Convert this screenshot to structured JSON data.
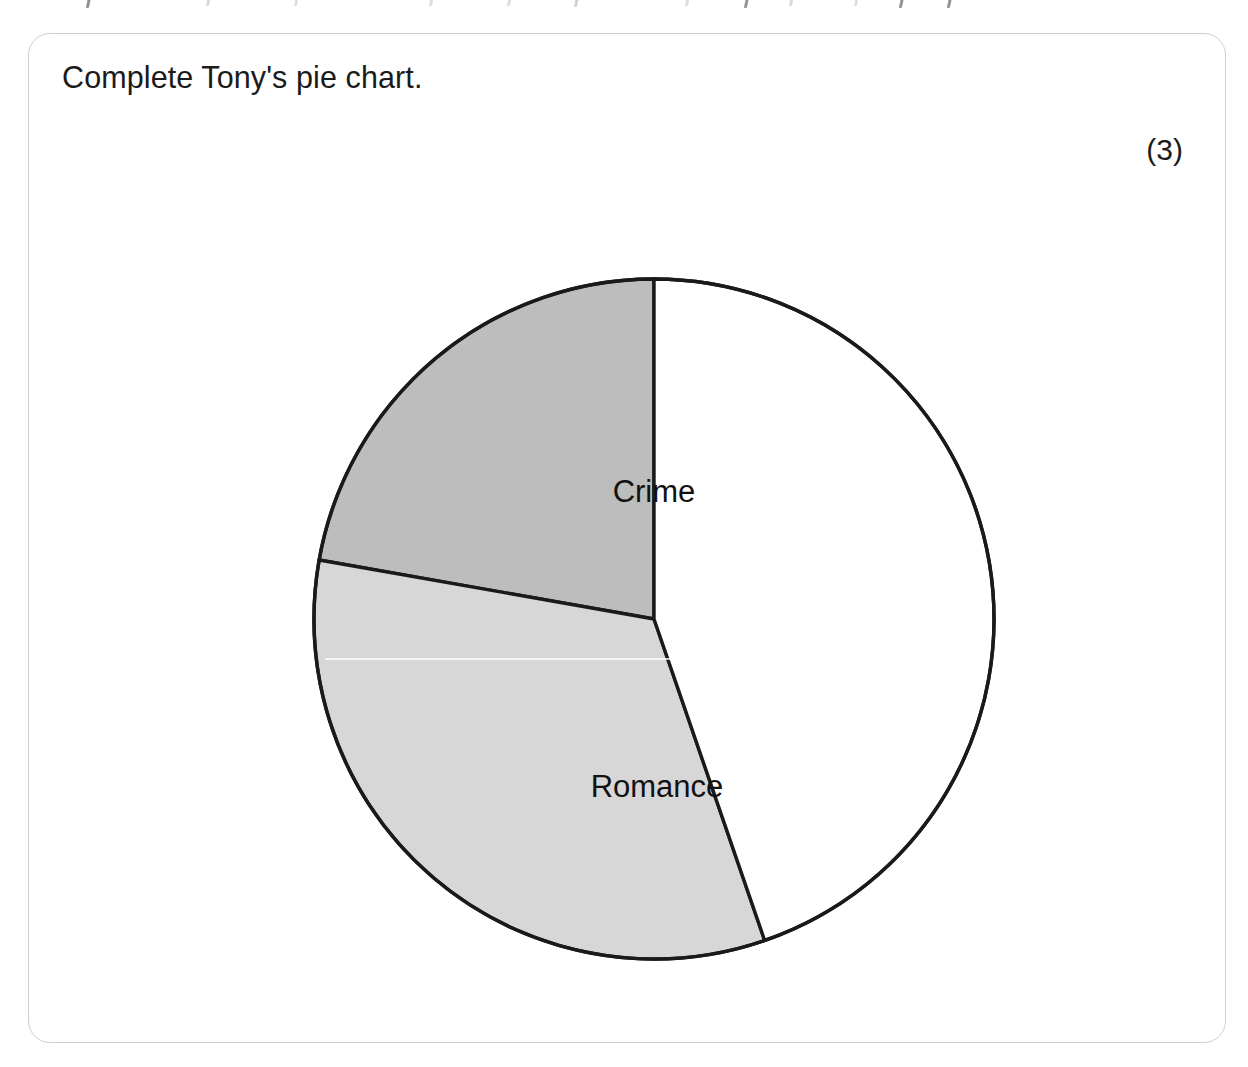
{
  "card": {
    "question_text": "Complete Tony's pie chart.",
    "marks": "(3)",
    "border_color": "#cfcfcf"
  },
  "chart_data": {
    "type": "pie",
    "title": "Complete Tony's pie chart.",
    "xlabel": "",
    "ylabel": "",
    "legend_position": "none",
    "grid": false,
    "total_degrees": 360,
    "note": "Third sector is drawn but left unlabelled and unshaded for the student to complete.",
    "categories": [
      "Crime",
      "Romance",
      ""
    ],
    "values": [
      80,
      119,
      161
    ],
    "value_units": "degrees",
    "slices": [
      {
        "label": "Crime",
        "start_angle_deg": 280,
        "end_angle_deg": 360,
        "sweep_deg": 80,
        "fill": "#bdbdbd",
        "stroke": "#1a1a1a",
        "label_x": 370,
        "label_y": 253,
        "labelled": true
      },
      {
        "label": "Romance",
        "start_angle_deg": 161,
        "end_angle_deg": 280,
        "sweep_deg": 119,
        "fill": "#d7d7d7",
        "stroke": "#1a1a1a",
        "label_x": 373,
        "label_y": 548,
        "labelled": true
      },
      {
        "label": "",
        "start_angle_deg": 0,
        "end_angle_deg": 161,
        "sweep_deg": 161,
        "fill": "#ffffff",
        "stroke": "#1a1a1a",
        "label_x": 0,
        "label_y": 0,
        "labelled": false
      }
    ],
    "geometry": {
      "center_x": 370,
      "center_y": 370,
      "radius": 340,
      "stroke_width": 3.4,
      "zero_angle": "12 o'clock",
      "direction": "clockwise"
    },
    "colors": {
      "crime": "#bdbdbd",
      "romance": "#d7d7d7",
      "blank": "#ffffff",
      "outline": "#1a1a1a"
    }
  }
}
